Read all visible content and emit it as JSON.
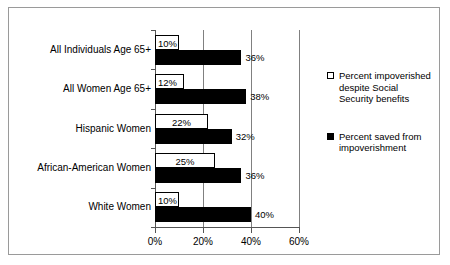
{
  "chart_data": {
    "type": "bar",
    "orientation": "horizontal",
    "title": "",
    "xlabel": "",
    "ylabel": "",
    "xlim": [
      0,
      60
    ],
    "grid": true,
    "grid_axis": "x",
    "legend_position": "right",
    "xticks": [
      "0%",
      "20%",
      "40%",
      "60%"
    ],
    "xtick_values": [
      0,
      20,
      40,
      60
    ],
    "categories": [
      "All Individuals Age 65+",
      "All Women Age 65+",
      "Hispanic Women",
      "African-American Women",
      "White Women"
    ],
    "series": [
      {
        "name": "Percent impoverished despite Social Security benefits",
        "style": "light",
        "values": [
          10,
          12,
          22,
          25,
          10
        ],
        "labels": [
          "10%",
          "12%",
          "22%",
          "25%",
          "10%"
        ]
      },
      {
        "name": "Percent saved from impoverishment",
        "style": "dark",
        "values": [
          36,
          38,
          32,
          36,
          40
        ],
        "labels": [
          "36%",
          "38%",
          "32%",
          "36%",
          "40%"
        ]
      }
    ]
  },
  "legend": {
    "entries": [
      {
        "label": "Percent impoverished despite Social Security benefits",
        "swatch": "light-square-swatch"
      },
      {
        "label": "Percent saved from impoverishment",
        "swatch": "dark-square-swatch"
      }
    ]
  },
  "colors": {
    "series_light_fill": "#ffffff",
    "series_light_border": "#000000",
    "series_dark_fill": "#000000",
    "axis": "#555555",
    "gridline": "#808080",
    "frame_border": "#9a9a9a",
    "background": "#ffffff",
    "text": "#000000"
  }
}
